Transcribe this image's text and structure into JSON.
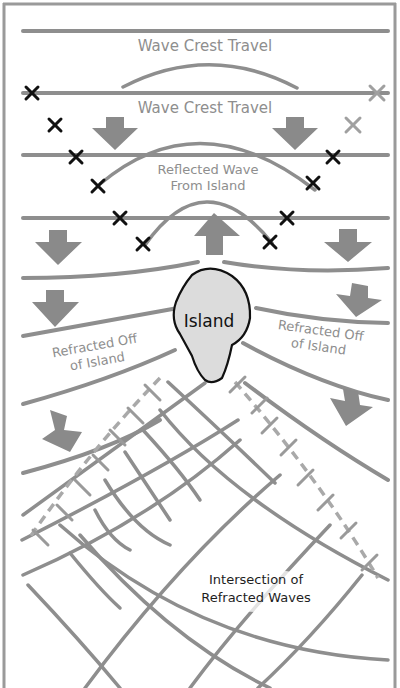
{
  "labels": {
    "crest_travel_1": "Wave Crest Travel",
    "crest_travel_2": "Wave Crest Travel",
    "reflected_line1": "Reflected Wave",
    "reflected_line2": "From Island",
    "island": "Island",
    "refracted_left_line1": "Refracted Off",
    "refracted_left_line2": "of Island",
    "refracted_right_line1": "Refracted Off",
    "refracted_right_line2": "of Island",
    "intersection_line1": "Intersection of",
    "intersection_line2": "Refracted Waves"
  },
  "colors": {
    "wave_line": "#8e8e8e",
    "dashed_line": "#a9a9a9",
    "arrow_fill": "#8a8a8a",
    "island_fill": "#dcdcdc",
    "island_outline": "#111111",
    "x_marker_dark": "#111111",
    "x_marker_light": "#a0a0a0",
    "frame": "#9a9a9a"
  },
  "elements": {
    "crest_lines_y": [
      31,
      93,
      155,
      218
    ],
    "reflected_arcs": 3,
    "direction_arrows_down": 8,
    "direction_arrows_up": 1,
    "x_markers_dark": 10,
    "x_markers_light": 2
  }
}
